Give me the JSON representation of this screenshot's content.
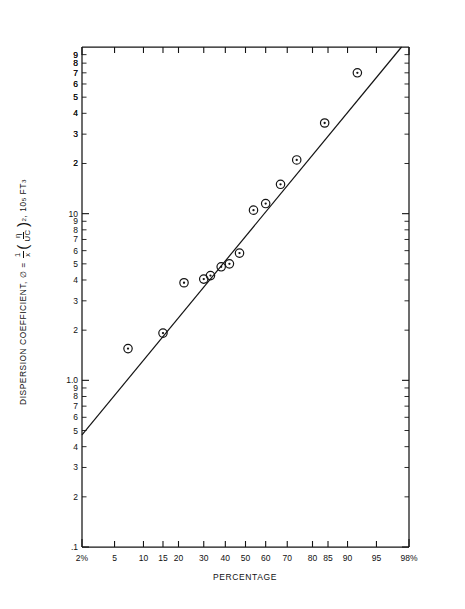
{
  "chart_data": {
    "type": "scatter",
    "title": "",
    "xlabel": "PERCENTAGE",
    "ylabel": "DISPERSION COEFFICIENT, ∅ = (1/x)(η/UC)², 10⁵ FT³",
    "x_scale": "probability",
    "y_scale": "log",
    "xlim": [
      2,
      98
    ],
    "ylim": [
      0.1,
      100
    ],
    "grid": false,
    "legend": "none",
    "x_ticklabels": [
      "2%",
      "5",
      "10",
      "15",
      "20",
      "30",
      "40",
      "50",
      "60",
      "70",
      "80",
      "85",
      "90",
      "95",
      "98%"
    ],
    "x_tickvalues": [
      2,
      5,
      10,
      15,
      20,
      30,
      40,
      50,
      60,
      70,
      80,
      85,
      90,
      95,
      98
    ],
    "y_ticklabels_top_decade": [
      "9",
      "8",
      "7",
      "6",
      "5",
      "4",
      "3",
      "2"
    ],
    "y_ticklabels_mid_decade": [
      "10",
      "9",
      "8",
      "7",
      "6",
      "5",
      "4",
      "3",
      "2"
    ],
    "y_ticklabels_low_decade": [
      "1.0",
      "9",
      "8",
      "7",
      "6",
      "5",
      "4",
      "3",
      "2",
      ".1"
    ],
    "y_decade_labels": [
      "100",
      "10",
      "1.0",
      ".1"
    ],
    "series": [
      {
        "name": "measured",
        "marker": "circle-dot",
        "points": [
          {
            "x": 7.0,
            "y": 1.55
          },
          {
            "x": 15.0,
            "y": 1.92
          },
          {
            "x": 22.0,
            "y": 3.85
          },
          {
            "x": 30.0,
            "y": 4.05
          },
          {
            "x": 33.0,
            "y": 4.25
          },
          {
            "x": 38.0,
            "y": 4.8
          },
          {
            "x": 42.0,
            "y": 5.0
          },
          {
            "x": 47.0,
            "y": 5.8
          },
          {
            "x": 54.0,
            "y": 10.5
          },
          {
            "x": 60.0,
            "y": 11.5
          },
          {
            "x": 67.0,
            "y": 15.0
          },
          {
            "x": 74.0,
            "y": 21.0
          },
          {
            "x": 84.0,
            "y": 35.0
          },
          {
            "x": 92.0,
            "y": 70.0
          }
        ]
      },
      {
        "name": "fit-line",
        "type": "line",
        "endpoints": [
          {
            "x": 2.0,
            "y": 0.47
          },
          {
            "x": 97.5,
            "y": 100.0
          }
        ]
      }
    ]
  },
  "axes": {
    "x_title": "PERCENTAGE",
    "y_title_prefix": "DISPERSION COEFFICIENT,",
    "y_title_symbol": "∅",
    "y_title_equals": "=",
    "y_frac1_num": "1",
    "y_frac1_den": "x",
    "y_frac2_num": "η",
    "y_frac2_den": "UC",
    "y_title_exp": "2",
    "y_title_suffix": "10",
    "y_title_suffix_exp": "5",
    "y_title_units": "FT",
    "y_title_units_exp": "3"
  },
  "colors": {
    "ink": "#141414",
    "background": "#ffffff"
  }
}
